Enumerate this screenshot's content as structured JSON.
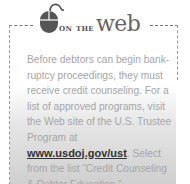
{
  "header": {
    "icon": "computer-mouse-icon",
    "prefix": "on the",
    "title": "web"
  },
  "body": {
    "text_before_link": "Before debtors can begin bank-ruptcy proceedings, they must receive credit counseling. For a list of approved programs, visit the Web site of the U.S. Trustee Program at ",
    "link_text": "www.usdoj.gov/ust",
    "text_after_link": ". Select from the list “Credit Counseling & Debtor Education.”"
  },
  "colors": {
    "accent": "#555555",
    "body_text": "#a6a6a6",
    "link": "#333333"
  }
}
